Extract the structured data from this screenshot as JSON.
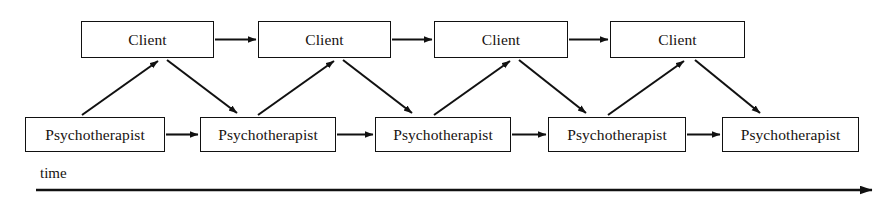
{
  "figure": {
    "background_color": "#ffffff",
    "stroke_color": "#111111",
    "text_color": "#17120f"
  },
  "rows": {
    "client_row": {
      "role_label": "Client",
      "boxes": [
        {
          "label": "Client",
          "x": 81,
          "y": 21,
          "w": 133,
          "h": 37
        },
        {
          "label": "Client",
          "x": 258,
          "y": 21,
          "w": 133,
          "h": 37
        },
        {
          "label": "Client",
          "x": 434,
          "y": 21,
          "w": 134,
          "h": 37
        },
        {
          "label": "Client",
          "x": 610,
          "y": 21,
          "w": 135,
          "h": 37
        }
      ]
    },
    "therapist_row": {
      "role_label": "Psychotherapist",
      "boxes": [
        {
          "label": "Psychotherapist",
          "x": 25,
          "y": 117,
          "w": 140,
          "h": 35
        },
        {
          "label": "Psychotherapist",
          "x": 200,
          "y": 117,
          "w": 136,
          "h": 35
        },
        {
          "label": "Psychotherapist",
          "x": 375,
          "y": 117,
          "w": 136,
          "h": 35
        },
        {
          "label": "Psychotherapist",
          "x": 548,
          "y": 117,
          "w": 138,
          "h": 35
        },
        {
          "label": "Psychotherapist",
          "x": 722,
          "y": 117,
          "w": 137,
          "h": 35
        }
      ]
    }
  },
  "time_axis": {
    "label": "time",
    "x_start": 36,
    "x_end": 878,
    "y": 190,
    "has_arrowhead": true,
    "direction": "left-to-right"
  },
  "edges": {
    "client_to_client": [
      {
        "from": "client-0",
        "to": "client-1"
      },
      {
        "from": "client-1",
        "to": "client-2"
      },
      {
        "from": "client-2",
        "to": "client-3"
      }
    ],
    "therapist_to_therapist": [
      {
        "from": "therapist-0",
        "to": "therapist-1"
      },
      {
        "from": "therapist-1",
        "to": "therapist-2"
      },
      {
        "from": "therapist-2",
        "to": "therapist-3"
      },
      {
        "from": "therapist-3",
        "to": "therapist-4"
      }
    ],
    "therapist_to_client": [
      {
        "from": "therapist-0",
        "to": "client-0"
      },
      {
        "from": "therapist-1",
        "to": "client-1"
      },
      {
        "from": "therapist-2",
        "to": "client-2"
      },
      {
        "from": "therapist-3",
        "to": "client-3"
      }
    ],
    "client_to_therapist": [
      {
        "from": "client-0",
        "to": "therapist-1"
      },
      {
        "from": "client-1",
        "to": "therapist-2"
      },
      {
        "from": "client-2",
        "to": "therapist-3"
      },
      {
        "from": "client-3",
        "to": "therapist-4"
      }
    ]
  }
}
